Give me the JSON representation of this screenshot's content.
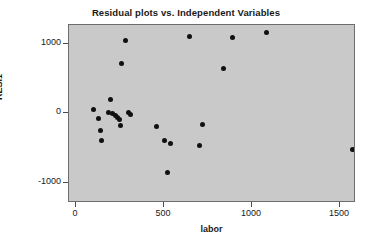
{
  "chart_data": {
    "type": "scatter",
    "title": "Residual plots vs. Independent Variables",
    "xlabel": "labor",
    "ylabel": "RESI1",
    "xlim": [
      -40,
      1590
    ],
    "ylim": [
      -1290,
      1270
    ],
    "grid": false,
    "legend": null,
    "xticks": [
      0,
      500,
      1000,
      1500
    ],
    "xtick_labels": [
      "0",
      "500",
      "1000",
      "1500"
    ],
    "yticks": [
      -1000,
      0,
      1000
    ],
    "ytick_labels": [
      "-1000",
      "0",
      "1000"
    ],
    "marker": "filled-circle",
    "marker_color": "#101010",
    "panel_color": "#c9c9c9",
    "series": [
      {
        "name": "RESI1 vs labor",
        "points": [
          {
            "x": 100,
            "y": 55
          },
          {
            "x": 130,
            "y": -70
          },
          {
            "x": 140,
            "y": -250
          },
          {
            "x": 145,
            "y": -390
          },
          {
            "x": 185,
            "y": 15
          },
          {
            "x": 195,
            "y": 200
          },
          {
            "x": 205,
            "y": -5
          },
          {
            "x": 225,
            "y": -30
          },
          {
            "x": 235,
            "y": -55
          },
          {
            "x": 245,
            "y": -85
          },
          {
            "x": 255,
            "y": -175
          },
          {
            "x": 260,
            "y": 720
          },
          {
            "x": 280,
            "y": 1040
          },
          {
            "x": 300,
            "y": 5
          },
          {
            "x": 310,
            "y": -15
          },
          {
            "x": 455,
            "y": -195
          },
          {
            "x": 505,
            "y": -385
          },
          {
            "x": 520,
            "y": -845
          },
          {
            "x": 535,
            "y": -430
          },
          {
            "x": 645,
            "y": 1105
          },
          {
            "x": 700,
            "y": -470
          },
          {
            "x": 720,
            "y": -165
          },
          {
            "x": 840,
            "y": 645
          },
          {
            "x": 890,
            "y": 1085
          },
          {
            "x": 1080,
            "y": 1155
          },
          {
            "x": 1570,
            "y": -520
          }
        ]
      }
    ]
  }
}
